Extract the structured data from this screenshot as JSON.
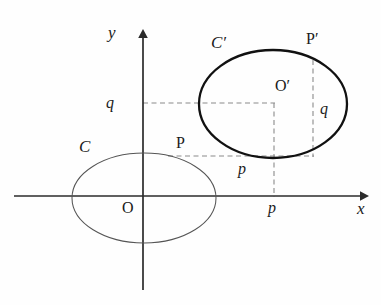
{
  "figure": {
    "background_color": "#fefefe",
    "stroke_color": "#1a1a1a",
    "thin_stroke_color": "#4a4a4a",
    "dashed_color": "#808080"
  },
  "axes": {
    "origin": {
      "x": 143,
      "y": 196
    },
    "x_axis": {
      "label": "x",
      "label_x": 357,
      "label_y": 200,
      "start_x": 14,
      "end_x": 366,
      "y": 196
    },
    "y_axis": {
      "label": "y",
      "label_x": 108,
      "label_y": 24,
      "x": 143,
      "start_y": 288,
      "end_y": 32
    },
    "origin_label": {
      "text": "O",
      "x": 122,
      "y": 200
    }
  },
  "curves": [
    {
      "name": "curve-c",
      "label": "C",
      "label_x": 79,
      "label_y": 138,
      "center_x": 144,
      "center_y": 198,
      "rx": 72,
      "ry": 45,
      "stroke_width": 1,
      "color": "#4a4a4a",
      "center_point_label": "O"
    },
    {
      "name": "curve-c-prime",
      "label": "C′",
      "label_x": 211,
      "label_y": 34,
      "center_x": 273,
      "center_y": 104,
      "rx": 74,
      "ry": 54,
      "stroke_width": 2.2,
      "color": "#1a1a1a",
      "center_point_label": "O′"
    }
  ],
  "points": [
    {
      "name": "point-p",
      "label": "P",
      "x": 168,
      "y": 156,
      "label_x": 176,
      "label_y": 135
    },
    {
      "name": "point-p-prime",
      "label": "P′",
      "x": 313,
      "y": 60,
      "label_x": 306,
      "label_y": 31
    },
    {
      "name": "point-o-prime",
      "label": "O′",
      "x": 273,
      "y": 104,
      "label_x": 275,
      "label_y": 78
    },
    {
      "name": "point-o-origin",
      "label": "O",
      "x": 143,
      "y": 196,
      "label_x": 122,
      "label_y": 200
    }
  ],
  "tick_labels": [
    {
      "name": "tick-q-y-axis",
      "text": "q",
      "x": 106,
      "y": 95,
      "axis": "y",
      "value_at": 103
    },
    {
      "name": "tick-p-x-axis",
      "text": "p",
      "x": 268,
      "y": 200,
      "axis": "x",
      "value_at": 274
    },
    {
      "name": "offset-p-horizontal",
      "text": "p",
      "x": 238,
      "y": 161,
      "axis": "none",
      "value_at": 0
    },
    {
      "name": "offset-q-vertical",
      "text": "q",
      "x": 320,
      "y": 101,
      "axis": "none",
      "value_at": 0
    }
  ],
  "dashed_segments": [
    {
      "name": "dash-q-level-to-o-prime",
      "x1": 143,
      "y1": 103,
      "x2": 275,
      "y2": 103,
      "orientation": "horizontal"
    },
    {
      "name": "dash-o-prime-vertical",
      "x1": 274,
      "y1": 103,
      "x2": 274,
      "y2": 196,
      "orientation": "vertical"
    },
    {
      "name": "dash-p-to-p-prime-base",
      "x1": 168,
      "y1": 156,
      "x2": 314,
      "y2": 156,
      "orientation": "horizontal"
    },
    {
      "name": "dash-p-prime-vertical",
      "x1": 313,
      "y1": 60,
      "x2": 313,
      "y2": 157,
      "orientation": "vertical"
    }
  ]
}
